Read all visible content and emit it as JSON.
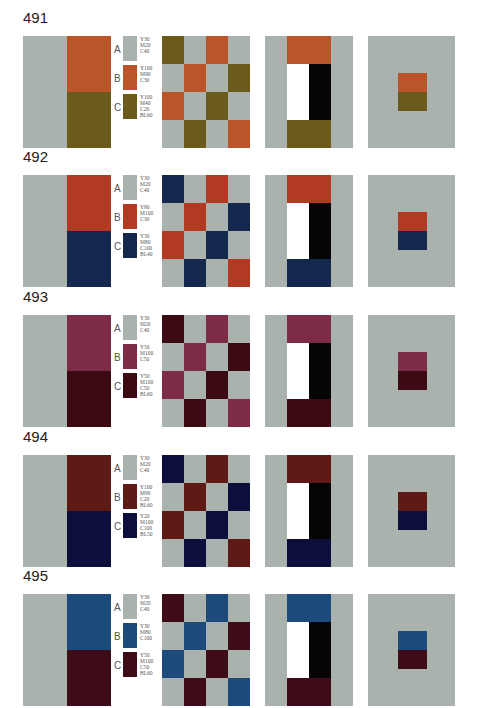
{
  "colors": {
    "A": "#a9b2ad"
  },
  "plates": [
    {
      "number": "491",
      "swatches": [
        {
          "letter": "A",
          "spec": "Y30\nM20\nC40",
          "color": "#a9b2ad"
        },
        {
          "letter": "B",
          "spec": "Y100\nM90\nC30",
          "color": "#bb5428"
        },
        {
          "letter": "C",
          "spec": "Y100\nM40\nC20\nBL60",
          "color": "#6b5a1c"
        }
      ],
      "checker": [
        "C",
        "A",
        "B",
        "A",
        "A",
        "B",
        "A",
        "C",
        "B",
        "A",
        "C",
        "A",
        "A",
        "C",
        "A",
        "B"
      ]
    },
    {
      "number": "492",
      "swatches": [
        {
          "letter": "A",
          "spec": "Y30\nM20\nC40",
          "color": "#a9b2ad"
        },
        {
          "letter": "B",
          "spec": "Y90\nM100\nC30",
          "color": "#b23a22"
        },
        {
          "letter": "C",
          "spec": "Y30\nM80\nC100\nBL40",
          "color": "#14284d"
        }
      ],
      "checker": [
        "C",
        "A",
        "B",
        "A",
        "A",
        "B",
        "A",
        "C",
        "B",
        "A",
        "C",
        "A",
        "A",
        "C",
        "A",
        "B"
      ]
    },
    {
      "number": "493",
      "swatches": [
        {
          "letter": "A",
          "spec": "Y30\nM20\nC40",
          "color": "#a9b2ad"
        },
        {
          "letter": "B",
          "spec": "Y50\nM100\nC50",
          "color": "#7c2c45"
        },
        {
          "letter": "C",
          "spec": "Y50\nM100\nC50\nBL60",
          "color": "#3b0a12"
        }
      ],
      "checker": [
        "C",
        "A",
        "B",
        "A",
        "A",
        "B",
        "A",
        "C",
        "B",
        "A",
        "C",
        "A",
        "A",
        "C",
        "A",
        "B"
      ]
    },
    {
      "number": "494",
      "swatches": [
        {
          "letter": "A",
          "spec": "Y30\nM20\nC40",
          "color": "#a9b2ad"
        },
        {
          "letter": "B",
          "spec": "Y100\nM90\nC20\nBL60",
          "color": "#5e1a14"
        },
        {
          "letter": "C",
          "spec": "Y20\nM100\nC100\nBL50",
          "color": "#0c0f3c"
        }
      ],
      "checker": [
        "C",
        "A",
        "B",
        "A",
        "A",
        "B",
        "A",
        "C",
        "B",
        "A",
        "C",
        "A",
        "A",
        "C",
        "A",
        "B"
      ]
    },
    {
      "number": "495",
      "swatches": [
        {
          "letter": "A",
          "spec": "Y30\nM20\nC40",
          "color": "#a9b2ad"
        },
        {
          "letter": "B",
          "spec": "Y30\nM80\nC100",
          "color": "#1c4a7a"
        },
        {
          "letter": "C",
          "spec": "Y50\nM100\nC50\nBL60",
          "color": "#3d0c16"
        }
      ],
      "checker": [
        "C",
        "A",
        "B",
        "A",
        "A",
        "B",
        "A",
        "C",
        "B",
        "A",
        "C",
        "A",
        "A",
        "C",
        "A",
        "B"
      ]
    }
  ]
}
